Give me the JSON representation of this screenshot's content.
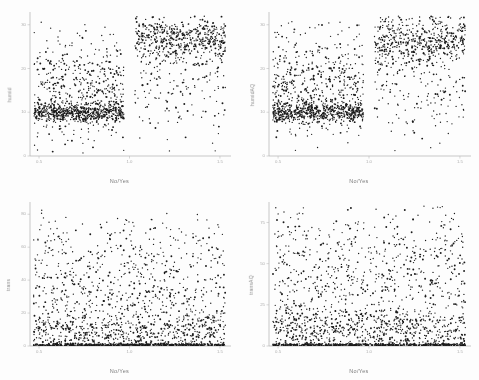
{
  "figure": {
    "background": "#fdfdfd",
    "point_color": "#1a1a1a",
    "axis_color": "#b0b0b0",
    "label_color": "#8d8d8d",
    "layout": "2x2",
    "style": "low-resolution scanned grayscale scatter matrix"
  },
  "chart_data": [
    {
      "type": "scatter",
      "panel": "top-left",
      "title": "",
      "xlabel": "No/Yes",
      "ylabel": "humid",
      "xlim": [
        0.45,
        1.55
      ],
      "ylim": [
        0,
        32
      ],
      "xticks": [
        0.5,
        1.0,
        1.5
      ],
      "xticklabels": [
        "0.5",
        "1.0",
        "1.5"
      ],
      "yticks": [
        0,
        10,
        20,
        30
      ],
      "yticklabels": [
        "0",
        "10",
        "20",
        "30"
      ],
      "grid": false,
      "legend": "none",
      "n_points": 1700,
      "clusters": [
        {
          "name": "no-band",
          "x_range": [
            0.47,
            0.97
          ],
          "y_center": 10.0,
          "y_spread": 1.1,
          "weight": 0.34,
          "note": "dense horizontal band near y=10"
        },
        {
          "name": "no-spread",
          "x_range": [
            0.47,
            0.97
          ],
          "y_center": 15.5,
          "y_spread": 6.0,
          "weight": 0.26,
          "note": "diffuse cloud above band"
        },
        {
          "name": "yes-high",
          "x_range": [
            1.03,
            1.53
          ],
          "y_center": 27.0,
          "y_spread": 2.6,
          "weight": 0.3,
          "note": "dense high cluster on right"
        },
        {
          "name": "yes-low",
          "x_range": [
            1.03,
            1.53
          ],
          "y_center": 17.0,
          "y_spread": 6.5,
          "weight": 0.1,
          "note": "sparse tail below right cluster"
        }
      ]
    },
    {
      "type": "scatter",
      "panel": "top-right",
      "title": "",
      "xlabel": "No/Yes",
      "ylabel": "humidAQ",
      "xlim": [
        0.45,
        1.55
      ],
      "ylim": [
        0,
        32
      ],
      "xticks": [
        0.5,
        1.0,
        1.5
      ],
      "xticklabels": [
        "0.5",
        "1.0",
        "1.5"
      ],
      "yticks": [
        0,
        10,
        20,
        30
      ],
      "yticklabels": [
        "0",
        "10",
        "20",
        "30"
      ],
      "grid": false,
      "legend": "none",
      "n_points": 1700,
      "clusters": [
        {
          "name": "no-band",
          "x_range": [
            0.47,
            0.97
          ],
          "y_center": 10.0,
          "y_spread": 1.2,
          "weight": 0.32,
          "note": "dense horizontal band near y=10"
        },
        {
          "name": "no-spread",
          "x_range": [
            0.47,
            0.97
          ],
          "y_center": 16.0,
          "y_spread": 6.2,
          "weight": 0.28,
          "note": "diffuse cloud above band"
        },
        {
          "name": "yes-high",
          "x_range": [
            1.03,
            1.53
          ],
          "y_center": 26.5,
          "y_spread": 2.8,
          "weight": 0.29,
          "note": "dense high cluster on right"
        },
        {
          "name": "yes-low",
          "x_range": [
            1.03,
            1.53
          ],
          "y_center": 16.5,
          "y_spread": 6.8,
          "weight": 0.11,
          "note": "sparse tail below right cluster"
        }
      ]
    },
    {
      "type": "scatter",
      "panel": "bottom-left",
      "title": "",
      "xlabel": "No/Yes",
      "ylabel": "trans",
      "xlim": [
        0.45,
        1.55
      ],
      "ylim": [
        0,
        85
      ],
      "xticks": [
        0.5,
        1.0,
        1.5
      ],
      "xticklabels": [
        "0.5",
        "1.0",
        "1.5"
      ],
      "yticks": [
        0,
        20,
        40,
        60,
        80
      ],
      "yticklabels": [
        "0",
        "20",
        "40",
        "60",
        "80"
      ],
      "grid": false,
      "legend": "none",
      "n_points": 1900,
      "clusters": [
        {
          "name": "zero-band",
          "x_range": [
            0.47,
            1.53
          ],
          "y_center": 0.6,
          "y_spread": 0.45,
          "weight": 0.3,
          "note": "solid black baseline at y=0"
        },
        {
          "name": "low-dense",
          "x_range": [
            0.47,
            1.53
          ],
          "y_center": 8.0,
          "y_spread": 7.0,
          "weight": 0.34,
          "note": "dense low scatter"
        },
        {
          "name": "mid",
          "x_range": [
            0.47,
            1.53
          ],
          "y_center": 30.0,
          "y_spread": 14.0,
          "weight": 0.24,
          "note": "mid-range scatter"
        },
        {
          "name": "high",
          "x_range": [
            0.47,
            1.53
          ],
          "y_center": 60.0,
          "y_spread": 13.0,
          "weight": 0.12,
          "note": "sparse upper scatter"
        }
      ]
    },
    {
      "type": "scatter",
      "panel": "bottom-right",
      "title": "",
      "xlabel": "No/Yes",
      "ylabel": "transAQ",
      "xlim": [
        0.45,
        1.55
      ],
      "ylim": [
        0,
        85
      ],
      "xticks": [
        0.5,
        1.0,
        1.5
      ],
      "xticklabels": [
        "0.5",
        "1.0",
        "1.5"
      ],
      "yticks": [
        0,
        25,
        50,
        75
      ],
      "yticklabels": [
        "0",
        "25",
        "50",
        "75"
      ],
      "grid": false,
      "legend": "none",
      "n_points": 1900,
      "clusters": [
        {
          "name": "zero-band",
          "x_range": [
            0.47,
            1.53
          ],
          "y_center": 0.6,
          "y_spread": 0.45,
          "weight": 0.28,
          "note": "solid black baseline at y=0"
        },
        {
          "name": "low-dense",
          "x_range": [
            0.47,
            1.53
          ],
          "y_center": 9.0,
          "y_spread": 7.5,
          "weight": 0.33,
          "note": "dense low scatter"
        },
        {
          "name": "mid",
          "x_range": [
            0.47,
            1.53
          ],
          "y_center": 32.0,
          "y_spread": 15.0,
          "weight": 0.25,
          "note": "mid-range scatter"
        },
        {
          "name": "high",
          "x_range": [
            0.47,
            1.53
          ],
          "y_center": 62.0,
          "y_spread": 14.0,
          "weight": 0.14,
          "note": "sparse upper scatter"
        }
      ]
    }
  ]
}
